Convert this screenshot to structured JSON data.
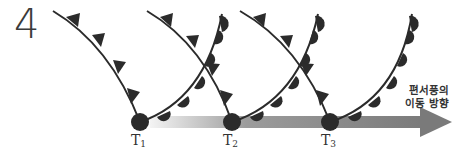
{
  "figure": {
    "panel_number": "4",
    "time_labels": [
      {
        "base": "T",
        "sub": "1"
      },
      {
        "base": "T",
        "sub": "2"
      },
      {
        "base": "T",
        "sub": "3"
      }
    ],
    "arrow_caption": {
      "line1": "편서풍의",
      "line2": "이동 방향"
    },
    "colors": {
      "front_line": "#2b2b2b",
      "symbols": "#2b2b2b",
      "arrow_start": "#f2f2f2",
      "arrow_end": "#7a7a7a",
      "text": "#333333"
    },
    "elements": {
      "cold_front": "line with triangles pointing toward advancing direction",
      "warm_front": "line with semicircles",
      "occlusion_points": [
        "T1",
        "T2",
        "T3"
      ]
    }
  }
}
